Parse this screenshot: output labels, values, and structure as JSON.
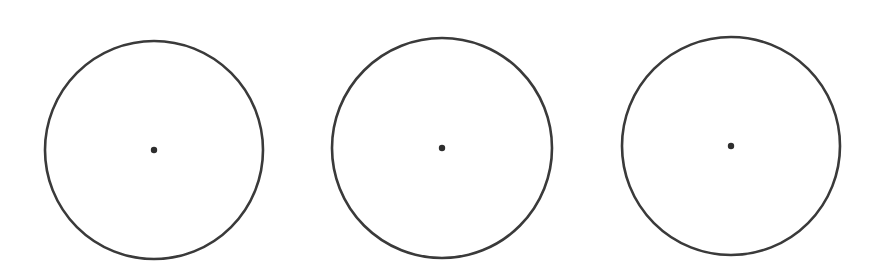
{
  "diagram": {
    "background": "#ffffff",
    "stroke_color": "#3a3a3a",
    "stroke_width": 2.6,
    "dot_color": "#2e2e2e",
    "dot_radius": 3.2,
    "circles": [
      {
        "id": "circle-1",
        "cx": 154,
        "cy": 150,
        "r": 109
      },
      {
        "id": "circle-2",
        "cx": 442,
        "cy": 148,
        "r": 110
      },
      {
        "id": "circle-3",
        "cx": 731,
        "cy": 146,
        "r": 109
      }
    ]
  }
}
